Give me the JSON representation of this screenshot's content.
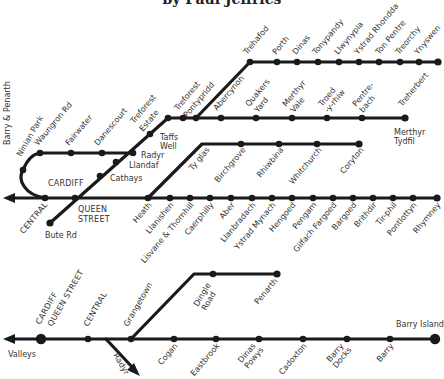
{
  "title": "by Paul Jeffries",
  "valleys_lines": {
    "main_line": {
      "stations": [
        "CENTRAL",
        "QUEEN STREET",
        "Heath",
        "Llanishen",
        "Lisvane & Thornhill",
        "Caerphilly",
        "Aber",
        "Llanbradach",
        "Ystrad Mynach",
        "Hengoed",
        "Pengam",
        "Gilfach Fargoed",
        "Bargoed",
        "Brithdir",
        "Tir-phil",
        "Pontlottyn",
        "Rhymney"
      ],
      "left_label": "Barry & Penarth"
    },
    "city_line": {
      "stations": [
        "Ninian Park",
        "Waungron Rd",
        "Fairwater",
        "Danescourt",
        "Radyr"
      ]
    },
    "cardiff_label": "CARDIFF",
    "bute_branch": {
      "stations": [
        "Bute Rd",
        "Cathays",
        "Llandaf",
        "Radyr",
        "Taffs Well"
      ]
    },
    "merthyr_line": {
      "stations": [
        "Treforest Estate",
        "Treforest",
        "Pontypridd",
        "Abercynon",
        "Quakers Yard",
        "Merthyr Vale",
        "Troed-y-rhiw",
        "Pentre-bach",
        "Merthyr Tydfil"
      ]
    },
    "rhondda_line": {
      "stations": [
        "Trehafod",
        "Porth",
        "Dinas",
        "Tonypandy",
        "Llwynypia",
        "Ystrad Rhondda",
        "Ton Pentre",
        "Treorchy",
        "Ynyswen",
        "Treherbert"
      ]
    },
    "coryton_line": {
      "stations": [
        "Ty glas",
        "Birchgrove",
        "Rhiwbina",
        "Whitchurch",
        "Coryton"
      ]
    }
  },
  "coast_lines": {
    "main_line": {
      "stations": [
        "CARDIFF QUEEN STREET",
        "CENTRAL",
        "Grangetown",
        "Cogan",
        "Eastbrook",
        "Dinas Powys",
        "Cadoxton",
        "Barry Docks",
        "Barry",
        "Barry Island"
      ],
      "left_label": "Valleys",
      "branch_arrow_label": "Radyr"
    },
    "penarth_branch": {
      "stations": [
        "Dingle Road",
        "Penarth"
      ]
    }
  },
  "labels": {
    "central": "CENTRAL",
    "queen": "QUEEN",
    "street": "STREET",
    "cardiff": "CARDIFF",
    "bute_rd": "Bute Rd",
    "cathays": "Cathays",
    "llandaf": "Llandaf",
    "radyr": "Radyr",
    "taffs": "Taffs",
    "well": "Well",
    "barry_penarth": "Barry & Penarth",
    "ninian": "Ninian Park",
    "waungron": "Waungron Rd",
    "fairwater": "Fairwater",
    "danescourt": "Danescourt",
    "treforest": "Treforest",
    "estate": "Estate",
    "pontypridd": "Pontypridd",
    "abercynon": "Abercynon",
    "quakers": "Quakers",
    "yard": "Yard",
    "merthyr": "Merthyr",
    "vale": "Vale",
    "troed": "Troed",
    "yrhiw": "-y-rhiw",
    "pentre": "Pentre-",
    "bach": "bach",
    "tydfil": "Tydfil",
    "trehafod": "Trehafod",
    "porth": "Porth",
    "dinas": "Dinas",
    "tonypandy": "Tonypandy",
    "llwynypia": "Llwynypia",
    "ystrad_rhondda": "Ystrad Rhondda",
    "ton_pentre": "Ton Pentre",
    "treorchy": "Treorchy",
    "ynyswen": "Ynyswen",
    "treherbert": "Treherbert",
    "ty_glas": "Ty glas",
    "birchgrove": "Birchgrove",
    "rhiwbina": "Rhiwbina",
    "whitchurch": "Whitchurch",
    "coryton": "Coryton",
    "heath": "Heath",
    "llanishen": "Llanishen",
    "lisvane": "Lisvane & Thornhill",
    "caerphilly": "Caerphilly",
    "aber": "Aber",
    "llanbradach": "Llanbradach",
    "ystrad_mynach": "Ystrad Mynach",
    "hengoed": "Hengoed",
    "pengam": "Pengam",
    "gilfach": "Gilfach Fargoed",
    "bargoed": "Bargoed",
    "brithdir": "Brithdir",
    "tirphil": "Tir-phil",
    "pontlottyn": "Pontlottyn",
    "rhymney": "Rhymney",
    "b_cardiff": "CARDIFF",
    "b_queen_street": "QUEEN STREET",
    "b_central": "CENTRAL",
    "grangetown": "Grangetown",
    "dingle": "Dingle",
    "road": "Road",
    "penarth": "Penarth",
    "valleys": "Valleys",
    "b_radyr": "Radyr",
    "cogan": "Cogan",
    "eastbrook": "Eastbrook",
    "dinas_b": "Dinas",
    "powys": "Powys",
    "cadoxton": "Cadoxton",
    "barry_b": "Barry",
    "docks": "Docks",
    "barry": "Barry",
    "barry_island": "Barry Island"
  }
}
